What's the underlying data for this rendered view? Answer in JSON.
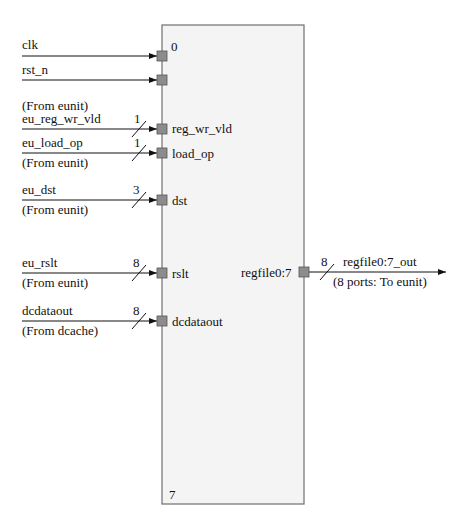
{
  "block": {
    "top_index": "0",
    "bottom_index": "7",
    "fill": "#f4f4f4",
    "border": "#6f6f6f",
    "port_fill": "#8c8c8c"
  },
  "inputs": [
    {
      "signal": "clk",
      "source": "",
      "port": "",
      "width": ""
    },
    {
      "signal": "rst_n",
      "source": "",
      "port": "",
      "width": ""
    },
    {
      "signal": "eu_reg_wr_vld",
      "source": "(From eunit)",
      "port": "reg_wr_vld",
      "width": "1"
    },
    {
      "signal": "eu_load_op",
      "source": "(From eunit)",
      "port": "load_op",
      "width": "1"
    },
    {
      "signal": "eu_dst",
      "source": "(From eunit)",
      "port": "dst",
      "width": "3"
    },
    {
      "signal": "eu_rslt",
      "source": "(From eunit)",
      "port": "rslt",
      "width": "8"
    },
    {
      "signal": "dcdataout",
      "source": "(From dcache)",
      "port": "dcdataout",
      "width": "8"
    }
  ],
  "output": {
    "port": "regfile0:7",
    "signal": "regfile0:7_out",
    "destination": "(8 ports: To eunit)",
    "width": "8"
  }
}
